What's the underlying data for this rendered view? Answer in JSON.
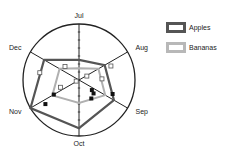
{
  "chart_data": {
    "type": "radar",
    "title": "",
    "categories": [
      "Jul",
      "Aug",
      "Sep",
      "Oct",
      "Nov",
      "Dec"
    ],
    "rmax": 1.0,
    "series": [
      {
        "name": "Apples",
        "color": "#555555",
        "values": [
          0.36,
          0.53,
          0.72,
          0.86,
          1.0,
          0.72
        ]
      },
      {
        "name": "Bananas",
        "color": "#b0b0b0",
        "values": [
          0.21,
          0.4,
          0.54,
          0.41,
          0.55,
          0.4
        ]
      }
    ],
    "legend_position": "upper right",
    "grid": false,
    "scatter_markers": {
      "open": [
        [
          -0.25,
          0.24
        ],
        [
          0.57,
          0.25
        ],
        [
          -0.7,
          0.13
        ],
        [
          0.14,
          0.07
        ],
        [
          0.41,
          0.02
        ],
        [
          -0.05,
          -0.02
        ],
        [
          -0.33,
          -0.13
        ]
      ],
      "filled": [
        [
          -0.6,
          -0.43
        ],
        [
          -0.45,
          -0.26
        ],
        [
          0.22,
          -0.33
        ],
        [
          0.23,
          -0.18
        ],
        [
          0.26,
          -0.24
        ],
        [
          0.6,
          -0.25
        ]
      ]
    }
  },
  "legend": {
    "items": [
      {
        "label": "Apples",
        "color": "#555555"
      },
      {
        "label": "Bananas",
        "color": "#b0b0b0"
      }
    ]
  }
}
